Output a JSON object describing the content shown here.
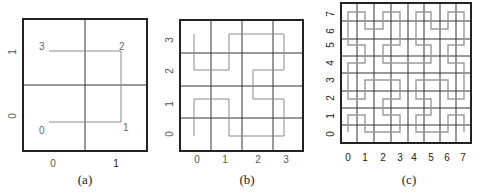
{
  "figure": {
    "panels": [
      {
        "id": "a",
        "caption": "(a)",
        "order": 1,
        "x_ticks": [
          "0",
          "1"
        ],
        "y_ticks": [
          "0",
          "1"
        ],
        "point_labels": [
          "0",
          "1",
          "2",
          "3"
        ],
        "path": [
          [
            0,
            0
          ],
          [
            1,
            0
          ],
          [
            1,
            1
          ],
          [
            0,
            1
          ]
        ]
      },
      {
        "id": "b",
        "caption": "(b)",
        "order": 2,
        "x_ticks": [
          "0",
          "1",
          "2",
          "3"
        ],
        "y_ticks": [
          "0",
          "1",
          "2",
          "3"
        ],
        "path": [
          [
            0,
            0
          ],
          [
            0,
            1
          ],
          [
            1,
            1
          ],
          [
            1,
            0
          ],
          [
            2,
            0
          ],
          [
            3,
            0
          ],
          [
            3,
            1
          ],
          [
            2,
            1
          ],
          [
            2,
            2
          ],
          [
            3,
            2
          ],
          [
            3,
            3
          ],
          [
            2,
            3
          ],
          [
            1,
            3
          ],
          [
            1,
            2
          ],
          [
            0,
            2
          ],
          [
            0,
            3
          ]
        ]
      },
      {
        "id": "c",
        "caption": "(c)",
        "order": 3,
        "x_ticks": [
          "0",
          "1",
          "2",
          "3",
          "4",
          "5",
          "6",
          "7"
        ],
        "y_ticks": [
          "0",
          "1",
          "2",
          "3",
          "4",
          "5",
          "6",
          "7"
        ]
      }
    ],
    "colors": {
      "frame": "#222222",
      "grid": "#333333",
      "curve": "#8a8a8a",
      "text": "#555555"
    }
  }
}
